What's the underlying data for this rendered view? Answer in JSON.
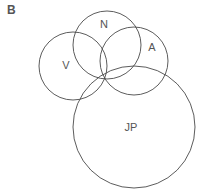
{
  "panel": {
    "label": "B"
  },
  "diagram": {
    "type": "venn",
    "circles": [
      {
        "id": "V",
        "label": "V",
        "cx": 73,
        "cy": 66,
        "r": 34,
        "label_x": 66,
        "label_y": 65
      },
      {
        "id": "N",
        "label": "N",
        "cx": 107,
        "cy": 45,
        "r": 34,
        "label_x": 104,
        "label_y": 24
      },
      {
        "id": "A",
        "label": "A",
        "cx": 134,
        "cy": 61,
        "r": 34,
        "label_x": 152,
        "label_y": 47
      },
      {
        "id": "JP",
        "label": "JP",
        "cx": 134,
        "cy": 127,
        "r": 61,
        "label_x": 131,
        "label_y": 127
      }
    ],
    "stroke_color": "#4a4a4a",
    "text_color": "#555555"
  }
}
